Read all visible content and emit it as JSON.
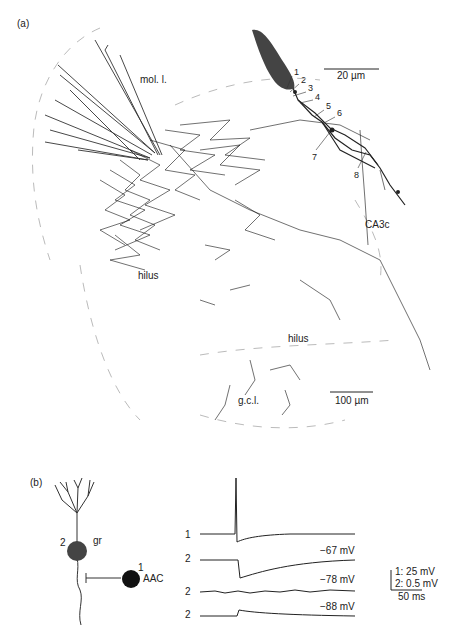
{
  "panel_a": {
    "label": "(a)",
    "regions": {
      "mol": "mol. l.",
      "hilus_left": "hilus",
      "hilus_center": "hilus",
      "ca3c": "CA3c",
      "gcl": "g.c.l."
    },
    "inset": {
      "scale_bar": "20 µm",
      "contact_numbers": [
        "1",
        "2",
        "3",
        "4",
        "5",
        "6",
        "7",
        "8"
      ]
    },
    "scale_bar": "100 µm"
  },
  "panel_b": {
    "label": "(b)",
    "cells": {
      "granule": {
        "number": "2",
        "name": "gr"
      },
      "aac": {
        "number": "1",
        "name": "AAC"
      }
    },
    "traces": [
      {
        "cell": "1",
        "potential": ""
      },
      {
        "cell": "2",
        "potential": "−67 mV"
      },
      {
        "cell": "2",
        "potential": "−78 mV"
      },
      {
        "cell": "2",
        "potential": "−88 mV"
      }
    ],
    "scale": {
      "v1": "1: 25 mV",
      "v2": "2: 0.5 mV",
      "t": "50 ms"
    }
  },
  "colors": {
    "ink": "#222222",
    "soma": "#444444",
    "boundary": "#bbbbbb"
  }
}
